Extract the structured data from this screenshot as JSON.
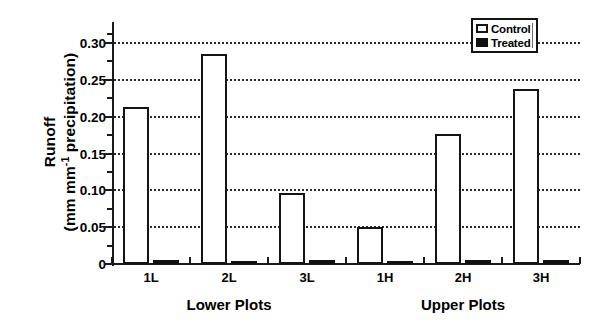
{
  "chart_data": {
    "type": "bar",
    "title": "",
    "xlabel": "",
    "ylabel_line1": "Runoff",
    "ylabel_line2_pre": "(mm mm",
    "ylabel_line2_sup": "-1",
    "ylabel_line2_post": " precipitation)",
    "categories": [
      "1L",
      "2L",
      "3L",
      "1H",
      "2H",
      "3H"
    ],
    "groups": [
      {
        "label": "Lower Plots",
        "categories": [
          "1L",
          "2L",
          "3L"
        ]
      },
      {
        "label": "Upper Plots",
        "categories": [
          "1H",
          "2H",
          "3H"
        ]
      }
    ],
    "series": [
      {
        "name": "Control",
        "color": "#ffffff",
        "edge": "#151515",
        "values": [
          0.213,
          0.285,
          0.097,
          0.05,
          0.177,
          0.237
        ]
      },
      {
        "name": "Treated",
        "color": "#101010",
        "edge": "#101010",
        "values": [
          0.005,
          0.001,
          0.006,
          0.002,
          0.006,
          0.006
        ]
      }
    ],
    "ylim": [
      0,
      0.315
    ],
    "ytick_values": [
      0,
      0.05,
      0.1,
      0.15,
      0.2,
      0.25,
      0.3
    ],
    "ytick_labels": [
      "0",
      "0.05",
      "0.10",
      "0.15",
      "0.20",
      "0.25",
      "0.30"
    ],
    "yminor_values": [
      0.025,
      0.075,
      0.125,
      0.175,
      0.225,
      0.275,
      0.3125
    ],
    "gridlines": [
      0.05,
      0.1,
      0.15,
      0.2,
      0.25,
      0.3
    ],
    "grid": true,
    "legend_position": "top-right",
    "legend_entries": [
      "Control",
      "Treated"
    ]
  }
}
